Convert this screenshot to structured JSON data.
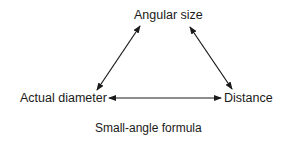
{
  "diagram": {
    "nodes": {
      "top": "Angular size",
      "left": "Actual diameter",
      "right": "Distance"
    },
    "edges": [
      {
        "from": "Actual diameter",
        "to": "Angular size",
        "style": "double-arrow"
      },
      {
        "from": "Angular size",
        "to": "Distance",
        "style": "double-arrow"
      },
      {
        "from": "Actual diameter",
        "to": "Distance",
        "style": "double-arrow"
      }
    ],
    "caption": "Small-angle formula",
    "colors": {
      "line": "#1a1a1a",
      "background": "#ffffff"
    }
  }
}
